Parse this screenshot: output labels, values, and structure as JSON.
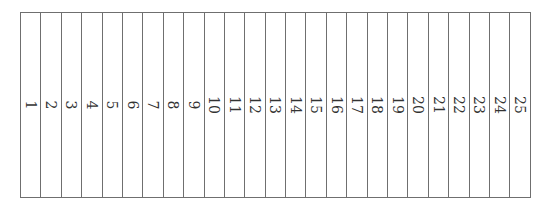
{
  "table": {
    "columns": [
      {
        "label": "1"
      },
      {
        "label": "2"
      },
      {
        "label": "3"
      },
      {
        "label": "4"
      },
      {
        "label": "5"
      },
      {
        "label": "6"
      },
      {
        "label": "7"
      },
      {
        "label": "8"
      },
      {
        "label": "9"
      },
      {
        "label": "10"
      },
      {
        "label": "11"
      },
      {
        "label": "12"
      },
      {
        "label": "13"
      },
      {
        "label": "14"
      },
      {
        "label": "15"
      },
      {
        "label": "16"
      },
      {
        "label": "17"
      },
      {
        "label": "18"
      },
      {
        "label": "19"
      },
      {
        "label": "20"
      },
      {
        "label": "21"
      },
      {
        "label": "22"
      },
      {
        "label": "23"
      },
      {
        "label": "24"
      },
      {
        "label": "25"
      }
    ],
    "border_color": "#6f6f6f",
    "text_rotation": "90deg clockwise"
  }
}
